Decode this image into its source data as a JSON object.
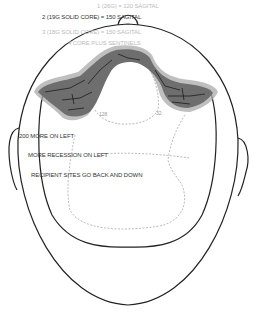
{
  "diagram": {
    "type": "hair-transplant-plan-top-view",
    "header_notes": [
      {
        "text": "1 (26G) = 120 SAGITAL",
        "style": "light"
      },
      {
        "text": "2 (19G SOLID CORE) = 150 SAGITAL",
        "style": "dark"
      },
      {
        "text": "3 (18G SOLID CORE) = 150 SAGITAL",
        "style": "light"
      },
      {
        "text": "4 CORE PLUS SENTINELS",
        "style": "light"
      }
    ],
    "zone_labels": [
      {
        "text": "128"
      },
      {
        "text": "32"
      }
    ],
    "side_notes": [
      {
        "text": "200 MORE ON LEFT"
      },
      {
        "text": "MORE RECESSION ON LEFT"
      },
      {
        "text": "RECIPIENT SITES GO BACK AND DOWN"
      }
    ],
    "colors": {
      "outline": "#222222",
      "hairline_fill": "#6e6e6e",
      "hairline_halo": "#a9a9a9",
      "dashed_zone": "#aaaaaa",
      "background": "#ffffff"
    }
  }
}
